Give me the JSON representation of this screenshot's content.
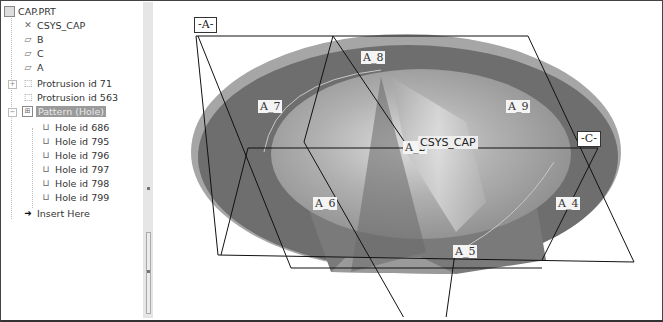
{
  "model_tree": {
    "items": [
      {
        "label": "CAP.PRT",
        "icon": "part-icon",
        "level": 0
      },
      {
        "label": "CSYS_CAP",
        "icon": "csys-icon",
        "level": 1
      },
      {
        "label": "B",
        "icon": "datum-plane-icon",
        "level": 1
      },
      {
        "label": "C",
        "icon": "datum-plane-icon",
        "level": 1
      },
      {
        "label": "A",
        "icon": "datum-plane-icon",
        "level": 1
      },
      {
        "label": "Protrusion id 71",
        "icon": "protrusion-icon",
        "level": 1,
        "expandable": true
      },
      {
        "label": "Protrusion id 563",
        "icon": "protrusion-icon",
        "level": 1
      },
      {
        "label": "Pattern (Hole)",
        "icon": "pattern-icon",
        "level": 1,
        "expandable": true,
        "selected": true
      },
      {
        "label": "Hole id 686",
        "icon": "hole-icon",
        "level": 2
      },
      {
        "label": "Hole id 795",
        "icon": "hole-icon",
        "level": 2
      },
      {
        "label": "Hole id 796",
        "icon": "hole-icon",
        "level": 2
      },
      {
        "label": "Hole id 797",
        "icon": "hole-icon",
        "level": 2
      },
      {
        "label": "Hole id 798",
        "icon": "hole-icon",
        "level": 2
      },
      {
        "label": "Hole id 799",
        "icon": "hole-icon",
        "level": 2
      },
      {
        "label": "Insert Here",
        "icon": "insert-arrow-icon",
        "level": 1
      }
    ]
  },
  "viewport": {
    "datum_tags": {
      "a": "-A-",
      "c": "-C-"
    },
    "csys_label": "CSYS_CAP",
    "axis_labels": [
      "A_8",
      "A_7",
      "A_9",
      "A_2",
      "A_6",
      "A_4",
      "A_5"
    ]
  },
  "colors": {
    "outer_ring": "#6e6e6e",
    "rim_light": "#a8a8a8",
    "inner_surface": "#9e9e9e",
    "highlight": "#d0d0d0",
    "selection_bg": "#9a9a9a"
  }
}
